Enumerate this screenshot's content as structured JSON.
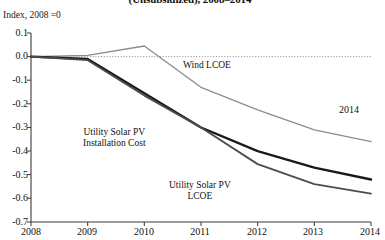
{
  "chart_data": {
    "type": "line",
    "title": "(Unsubsidized), 2008–2014",
    "subtitle": "Index, 2008 =0",
    "xlabel": "",
    "ylabel": "Index, 2008 =0",
    "x": [
      2008,
      2009,
      2010,
      2011,
      2012,
      2013,
      2014
    ],
    "xticklabels": [
      "2008",
      "2009",
      "2010",
      "2011",
      "2012",
      "2013",
      "2014"
    ],
    "yticklabels": [
      "0.1",
      "0.0",
      "-0.1",
      "-0.2",
      "-0.3",
      "-0.4",
      "-0.5",
      "-0.6",
      "-0.7"
    ],
    "yticks": [
      0.1,
      0.0,
      -0.1,
      -0.2,
      -0.3,
      -0.4,
      -0.5,
      -0.6,
      -0.7
    ],
    "xlim": [
      2008,
      2014
    ],
    "ylim": [
      -0.7,
      0.1
    ],
    "grid": false,
    "zero_line": true,
    "legend_position": "inline-labels",
    "series": [
      {
        "name": "Wind LCOE",
        "color": "#8c8c8c",
        "width": 1.3,
        "values": [
          0.0,
          0.005,
          0.045,
          -0.13,
          -0.225,
          -0.31,
          -0.36
        ]
      },
      {
        "name": "Utility Solar PV Installation Cost",
        "color": "#1a1a1a",
        "width": 2.4,
        "values": [
          0.0,
          -0.01,
          -0.155,
          -0.3,
          -0.4,
          -0.47,
          -0.52
        ]
      },
      {
        "name": "Utility Solar PV LCOE",
        "color": "#4d4d4d",
        "width": 1.8,
        "values": [
          0.0,
          -0.015,
          -0.165,
          -0.3,
          -0.455,
          -0.54,
          -0.58
        ]
      }
    ],
    "annotations": [
      {
        "text": "Wind LCOE",
        "x": 2011.05,
        "y": -0.085
      },
      {
        "text": "Utility Solar PV\nInstallation Cost",
        "x": 2009.85,
        "y": -0.345
      },
      {
        "text": "Utility Solar PV\nLCOE",
        "x": 2011.75,
        "y": -0.58
      },
      {
        "text": "2014",
        "x": 2013.9,
        "y": -0.205
      }
    ]
  },
  "labels": {
    "title": "(Unsubsidized), 2008–2014",
    "axis_note": "Index, 2008 =0",
    "wind_lcoe": "Wind LCOE",
    "solar_install_line1": "Utility Solar PV",
    "solar_install_line2": "Installation Cost",
    "solar_lcoe_line1": "Utility Solar PV",
    "solar_lcoe_line2": "LCOE",
    "annot_2014": "2014",
    "y0": "0.1",
    "y1": "0.0",
    "y2": "-0.1",
    "y3": "-0.2",
    "y4": "-0.3",
    "y5": "-0.4",
    "y6": "-0.5",
    "y7": "-0.6",
    "y8": "-0.7",
    "x0": "2008",
    "x1": "2009",
    "x2": "2010",
    "x3": "2011",
    "x4": "2012",
    "x5": "2013",
    "x6": "2014"
  }
}
